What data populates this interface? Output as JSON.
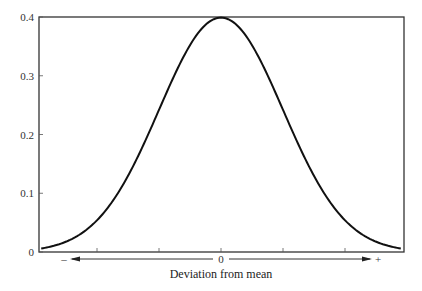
{
  "chart_data": {
    "type": "line",
    "title": "",
    "xlabel": "Deviation from mean",
    "ylabel": "",
    "ylim": [
      0,
      0.4
    ],
    "xlim": [
      -2.9,
      2.9
    ],
    "grid": false,
    "legend": null,
    "yticks": [
      0,
      0.1,
      0.2,
      0.3,
      0.4
    ],
    "ytick_labels": [
      "0",
      "0.1",
      "0.2",
      "0.3",
      "0.4"
    ],
    "xticks": [
      -2,
      -1,
      0,
      1,
      2
    ],
    "xtick_labels": [
      "",
      "",
      "0",
      "",
      ""
    ],
    "x_arrow": {
      "left_label": "–",
      "center_label": "0",
      "right_label": "+"
    },
    "series": [
      {
        "name": "Normal distribution (standard)",
        "x": [
          -2.9,
          -2.5,
          -2.0,
          -1.5,
          -1.0,
          -0.5,
          0.0,
          0.5,
          1.0,
          1.5,
          2.0,
          2.5,
          2.9
        ],
        "y": [
          0.006,
          0.018,
          0.054,
          0.13,
          0.242,
          0.352,
          0.399,
          0.352,
          0.242,
          0.13,
          0.054,
          0.018,
          0.006
        ]
      }
    ]
  }
}
